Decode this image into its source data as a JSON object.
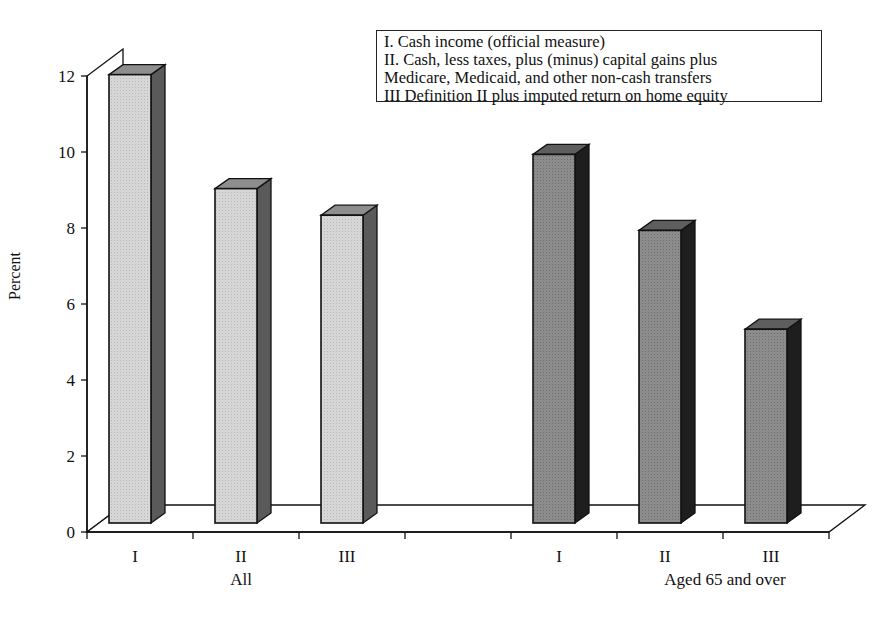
{
  "chart_data": {
    "type": "bar",
    "style": "3d-column",
    "title": "",
    "xlabel": "",
    "ylabel": "Percent",
    "ylim": [
      0,
      12
    ],
    "yticks": [
      0,
      2,
      4,
      6,
      8,
      10,
      12
    ],
    "grid": false,
    "legend_position": "top-right (text box)",
    "groups": [
      {
        "name": "All",
        "categories": [
          "I",
          "II",
          "III"
        ],
        "values": [
          11.8,
          8.8,
          8.1
        ],
        "color": "#d0d0d0"
      },
      {
        "name": "Aged 65 and over",
        "categories": [
          "I",
          "II",
          "III"
        ],
        "values": [
          9.7,
          7.7,
          5.1
        ],
        "color": "#8a8a8a"
      }
    ],
    "legend": [
      "I.  Cash income (official measure)",
      "II. Cash, less taxes, plus (minus) capital gains plus",
      "Medicare, Medicaid, and other non-cash transfers",
      "III Definition II plus imputed return on home equity"
    ]
  }
}
